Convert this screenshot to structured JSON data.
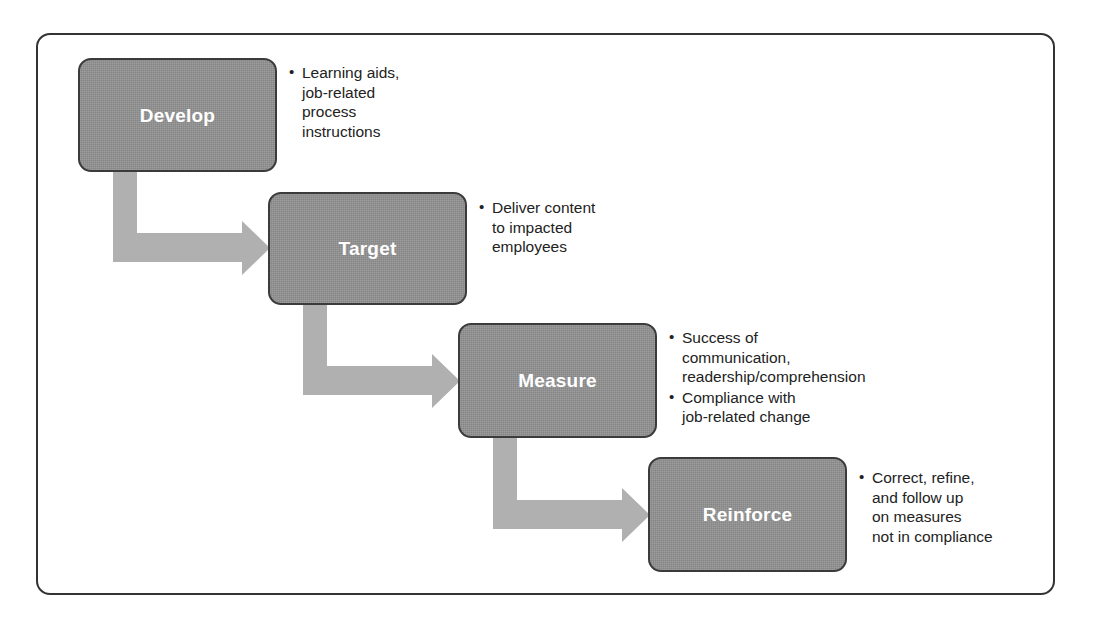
{
  "diagram": {
    "colors": {
      "box_fill": "#919191",
      "box_border": "#3b3b3b",
      "box_label": "#ffffff",
      "arrow": "#b0b0b0",
      "frame_border": "#333333",
      "note_text": "#222222",
      "background": "#ffffff"
    },
    "steps": [
      {
        "id": "develop",
        "label": "Develop",
        "notes": [
          "Learning aids,\njob-related\nprocess\ninstructions"
        ]
      },
      {
        "id": "target",
        "label": "Target",
        "notes": [
          "Deliver content\nto impacted\nemployees"
        ]
      },
      {
        "id": "measure",
        "label": "Measure",
        "notes": [
          "Success of\ncommunication,\nreadership/comprehension",
          "Compliance with\njob-related change"
        ]
      },
      {
        "id": "reinforce",
        "label": "Reinforce",
        "notes": [
          "Correct, refine,\nand follow up\non measures\nnot in compliance"
        ]
      }
    ],
    "bullet_glyph": "•",
    "connectors": [
      {
        "id": "develop-to-target",
        "from": "develop",
        "to": "target"
      },
      {
        "id": "target-to-measure",
        "from": "target",
        "to": "measure"
      },
      {
        "id": "measure-to-reinforce",
        "from": "measure",
        "to": "reinforce"
      }
    ]
  }
}
